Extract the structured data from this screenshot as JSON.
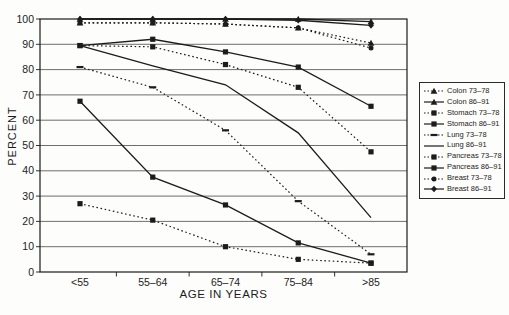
{
  "chart_data": {
    "type": "line",
    "title": "",
    "xlabel": "AGE IN YEARS",
    "ylabel": "PERCENT",
    "categories": [
      "<55",
      "55–64",
      "65–74",
      "75–84",
      ">85"
    ],
    "ylim": [
      0,
      100
    ],
    "ytick_step": 10,
    "ytick_labels": [
      "100",
      "90",
      "80",
      "70",
      "60",
      "50",
      "40",
      "30",
      "20",
      "10",
      "0"
    ],
    "grid": "horizontal",
    "legend_position": "right",
    "ink_color": "#1c1c1c",
    "series": [
      {
        "name": "Colon 73–78",
        "line": "dotted",
        "marker": "triangle",
        "values": [
          98.5,
          98.5,
          98,
          96.5,
          90.5
        ]
      },
      {
        "name": "Colon 86–91",
        "line": "solid",
        "marker": "triangle",
        "values": [
          100,
          100,
          100,
          100,
          99
        ]
      },
      {
        "name": "Stomach 73–78",
        "line": "dotted",
        "marker": "square",
        "values": [
          89.5,
          89,
          82,
          73,
          47.5
        ]
      },
      {
        "name": "Stomach 86–91",
        "line": "solid",
        "marker": "square",
        "values": [
          89.5,
          92,
          87,
          81,
          65.5
        ]
      },
      {
        "name": "Lung 73–78",
        "line": "dotted",
        "marker": "dash",
        "values": [
          81,
          73,
          56,
          28,
          7
        ]
      },
      {
        "name": "Lung 86–91",
        "line": "solid",
        "marker": "none",
        "values": [
          89.5,
          81.5,
          74,
          55,
          21.5
        ]
      },
      {
        "name": "Pancreas 73–78",
        "line": "dotted",
        "marker": "square",
        "values": [
          27,
          20.5,
          10,
          5,
          3.5
        ]
      },
      {
        "name": "Pancreas 86–91",
        "line": "solid",
        "marker": "square",
        "values": [
          67.5,
          37.5,
          26.5,
          11.5,
          3.5
        ]
      },
      {
        "name": "Breast 73–78",
        "line": "dotted",
        "marker": "circle",
        "values": [
          98.5,
          98.5,
          98,
          96.5,
          88.5
        ]
      },
      {
        "name": "Breast 86–91",
        "line": "solid",
        "marker": "diamond",
        "values": [
          100,
          100,
          100,
          99.5,
          97.5
        ]
      }
    ]
  }
}
